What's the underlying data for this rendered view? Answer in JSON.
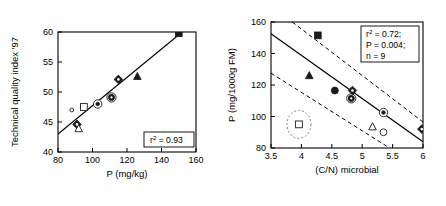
{
  "figure": {
    "panels": [
      "left",
      "right"
    ]
  },
  "chart_data": [
    {
      "id": "panel-left",
      "type": "scatter",
      "title": "",
      "xlabel": "P (mg/kg)",
      "ylabel": "Technical quality index '97",
      "xlim": [
        80,
        160
      ],
      "ylim": [
        40,
        60
      ],
      "xticks": [
        80,
        100,
        120,
        140,
        160
      ],
      "yticks": [
        40,
        45,
        50,
        55,
        60
      ],
      "xticklabels": [
        "80",
        "100",
        "120",
        "140",
        "160"
      ],
      "yticklabels": [
        "40",
        "45",
        "50",
        "55",
        "60"
      ],
      "grid": false,
      "legend": "none",
      "annotation": "r2 = 0.93",
      "annotation_parts": {
        "symbol": "r",
        "exponent": "2",
        "rest": " = 0.93"
      },
      "fit_line": {
        "x": [
          80,
          152
        ],
        "y": [
          43.0,
          60.0
        ]
      },
      "points": [
        {
          "x": 88,
          "y": 47.0,
          "marker": "small-open-circle"
        },
        {
          "x": 91,
          "y": 44.6,
          "marker": "target-diamond"
        },
        {
          "x": 92,
          "y": 43.9,
          "marker": "open-triangle"
        },
        {
          "x": 95,
          "y": 47.5,
          "marker": "open-square"
        },
        {
          "x": 103,
          "y": 48.0,
          "marker": "circled-dot"
        },
        {
          "x": 111,
          "y": 49.1,
          "marker": "circled-filled-circle"
        },
        {
          "x": 115,
          "y": 52.1,
          "marker": "target-diamond"
        },
        {
          "x": 126,
          "y": 52.6,
          "marker": "filled-triangle"
        },
        {
          "x": 150,
          "y": 59.8,
          "marker": "filled-square"
        }
      ]
    },
    {
      "id": "panel-right",
      "type": "scatter",
      "title": "",
      "xlabel": "(C/N) microbial",
      "ylabel": "P (mg/1000g FM)",
      "xlim": [
        3.5,
        6.0
      ],
      "ylim": [
        80,
        160
      ],
      "xticks": [
        3.5,
        4,
        4.5,
        5,
        5.5,
        6
      ],
      "yticks": [
        80,
        100,
        120,
        140,
        160
      ],
      "xticklabels": [
        "3.5",
        "4",
        "4.5",
        "5",
        "5.5",
        "6"
      ],
      "yticklabels": [
        "80",
        "100",
        "120",
        "140",
        "160"
      ],
      "grid": false,
      "legend": "none",
      "stats": {
        "r2_label": "r",
        "r2_exp": "2",
        "r2_value": " = 0.72;",
        "p_line": "P = 0.004;",
        "n_line": "n = 9"
      },
      "fit_line": {
        "x": [
          3.5,
          6.0
        ],
        "y": [
          152.5,
          84.0
        ]
      },
      "ci_upper": {
        "x": [
          3.85,
          6.0
        ],
        "y": [
          160.0,
          96.5
        ]
      },
      "ci_lower": {
        "x": [
          3.5,
          5.45
        ],
        "y": [
          127.5,
          80.0
        ]
      },
      "points": [
        {
          "x": 4.27,
          "y": 151.5,
          "marker": "filled-square"
        },
        {
          "x": 4.13,
          "y": 126.0,
          "marker": "filled-triangle"
        },
        {
          "x": 4.55,
          "y": 116.5,
          "marker": "filled-circle"
        },
        {
          "x": 4.84,
          "y": 116.5,
          "marker": "target-diamond"
        },
        {
          "x": 4.82,
          "y": 111.5,
          "marker": "circled-filled-circle"
        },
        {
          "x": 5.35,
          "y": 102.5,
          "marker": "circled-dot"
        },
        {
          "x": 5.17,
          "y": 93.5,
          "marker": "open-triangle"
        },
        {
          "x": 5.35,
          "y": 90.0,
          "marker": "open-circle"
        },
        {
          "x": 5.98,
          "y": 92.0,
          "marker": "target-diamond"
        },
        {
          "x": 3.96,
          "y": 95.0,
          "marker": "open-square",
          "outlier": true
        }
      ],
      "outlier_marker": {
        "x": 3.96,
        "y": 95.0,
        "note": "dotted-ellipse-excluded"
      }
    }
  ]
}
